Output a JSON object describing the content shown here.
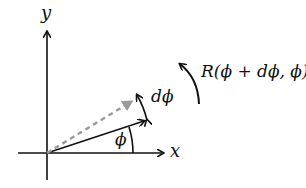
{
  "diagram": {
    "axes": {
      "x_label": "x",
      "y_label": "y"
    },
    "labels": {
      "angle": "ϕ",
      "delta_angle": "dϕ",
      "rotation": "R(ϕ + dϕ, ϕ)"
    },
    "colors": {
      "solid": "#111111",
      "dashed": "#9a9a9a",
      "background": "#ffffff"
    }
  }
}
